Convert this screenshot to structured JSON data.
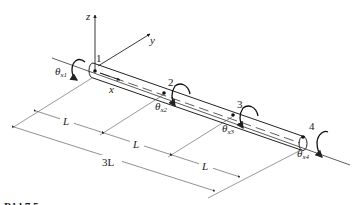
{
  "diagram": {
    "axes": {
      "z": "z",
      "y": "y",
      "x": "x"
    },
    "nodes": [
      {
        "id": "1",
        "rotation": "θ",
        "sub": "x1"
      },
      {
        "id": "2",
        "rotation": "θ",
        "sub": "x2"
      },
      {
        "id": "3",
        "rotation": "θ",
        "sub": "x3"
      },
      {
        "id": "4",
        "rotation": "θ",
        "sub": "x4"
      }
    ],
    "dimensions": {
      "segment1": "L",
      "segment2": "L",
      "segment3": "L",
      "total": "3L"
    },
    "caption_partial": "P   bl   7.5"
  }
}
